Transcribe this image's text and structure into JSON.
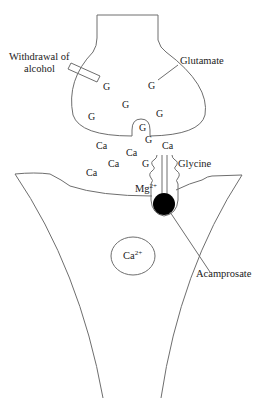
{
  "diagram": {
    "labels": {
      "withdrawal_line1": "Withdrawal of",
      "withdrawal_line2": "alcohol",
      "glutamate": "Glutamate",
      "glycine": "Glycine",
      "mg": "Mg",
      "mg_sup": "2+",
      "acamprosate": "Acamprosate",
      "ca_ion": "Ca",
      "ca_ion_sup": "2+"
    },
    "glutamate_symbol": "G",
    "calcium_symbol": "Ca",
    "colors": {
      "line": "#6e6e6e",
      "text": "#222222",
      "blocker": "#000000"
    }
  }
}
